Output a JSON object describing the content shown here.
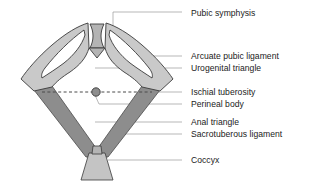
{
  "figure": {
    "kind": "anatomical-diagram",
    "background_color": "#ffffff",
    "line_color": "#2a2a2a",
    "leader_line_color": "#9a9a9a",
    "text_color": "#1b1b1b"
  },
  "palette": {
    "bone_light": "#c9c9c9",
    "bone_light_stroke": "#3a3a3a",
    "ligament_dark": "#8d8d8d",
    "ligament_dark_stroke": "#4a4a4a",
    "symphysis_mid": "#b4b4b4",
    "coccyx_fill": "#c4c4c4",
    "perineal_body_fill": "#8d8d8d",
    "dashed_line": "#4a4a4a"
  },
  "labels": [
    {
      "id": "pubic-symphysis",
      "text": "Pubic symphysis",
      "x": 191,
      "y": 8,
      "leader": {
        "x1": 182,
        "y1": 12,
        "x2": 113,
        "y2": 12,
        "x3": 113,
        "y3": 26
      }
    },
    {
      "id": "arcuate-pubic-ligament",
      "text": "Arcuate pubic ligament",
      "x": 191,
      "y": 52,
      "leader": {
        "x1": 182,
        "y1": 56,
        "x2": 112,
        "y2": 56
      }
    },
    {
      "id": "urogenital-triangle",
      "text": "Urogenital triangle",
      "x": 191,
      "y": 64,
      "leader": {
        "x1": 182,
        "y1": 68,
        "x2": 95,
        "y2": 68
      }
    },
    {
      "id": "ischial-tuberosity",
      "text": "Ischial tuberosity",
      "x": 191,
      "y": 88,
      "leader": {
        "x1": 182,
        "y1": 92,
        "x2": 146,
        "y2": 92
      }
    },
    {
      "id": "perineal-body",
      "text": "Perineal body",
      "x": 191,
      "y": 100,
      "leader": {
        "x1": 182,
        "y1": 104,
        "x2": 99,
        "y2": 104,
        "x3": 95,
        "y3": 95
      }
    },
    {
      "id": "anal-triangle",
      "text": "Anal triangle",
      "x": 191,
      "y": 118,
      "leader": {
        "x1": 182,
        "y1": 122,
        "x2": 95,
        "y2": 122
      }
    },
    {
      "id": "sacrotuberous-ligament",
      "text": "Sacrotuberous ligament",
      "x": 191,
      "y": 130,
      "leader": {
        "x1": 182,
        "y1": 134,
        "x2": 122,
        "y2": 134
      }
    },
    {
      "id": "coccyx",
      "text": "Coccyx",
      "x": 191,
      "y": 156,
      "leader": {
        "x1": 182,
        "y1": 160,
        "x2": 108,
        "y2": 160
      }
    }
  ],
  "structures": {
    "pubic_symphysis_note": "narrow vertical waisted band at apex between the two pubic bodies",
    "left_hip_bone_note": "light grey crescent / ischiopubic ramus sweeping down-left",
    "right_hip_bone_note": "light grey crescent / ischiopubic ramus sweeping down-right",
    "sacrotuberous_ligaments_note": "two dark grey bands converging downward to coccyx",
    "perineal_body_note": "filled circle at midpoint of the intertuberous dashed line",
    "intertuberous_line_note": "horizontal dashed line joining the two ischial tuberosities",
    "coccyx_note": "light grey trapezoid at the bottom apex"
  }
}
